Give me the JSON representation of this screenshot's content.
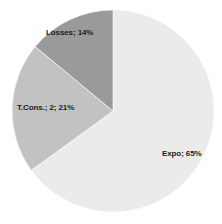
{
  "chart_data": {
    "type": "pie",
    "title": "",
    "subtitle": "",
    "xlabel": "",
    "ylabel": "",
    "grid": false,
    "legend": false,
    "legend_position": "none",
    "labels_inside": true,
    "background_color": "#ffffff",
    "categories": [
      "Expo",
      "T.Cons.",
      "Losses"
    ],
    "values": [
      65,
      21,
      14
    ],
    "value_unit": "%",
    "slices": [
      {
        "name": "Expo",
        "label": "Expo; 65%",
        "value": 65,
        "percent": 65,
        "color": "#ebebeb",
        "start_angle": 0,
        "end_angle": 234
      },
      {
        "name": "T.Cons.",
        "label": "T.Cons.; 2; 21%",
        "value": 21,
        "percent": 21,
        "series_index": 2,
        "color": "#c2c2c2",
        "start_angle": 234,
        "end_angle": 309.6
      },
      {
        "name": "Losses",
        "label": "Losses; 14%",
        "value": 14,
        "percent": 14,
        "color": "#9a9a9a",
        "start_angle": 309.6,
        "end_angle": 360
      }
    ],
    "annotations": [
      "Expo; 65%",
      "T.Cons.; 2; 21%",
      "Losses; 14%"
    ]
  },
  "geometry": {
    "center_x": 113,
    "center_y": 111,
    "radius": 101
  }
}
